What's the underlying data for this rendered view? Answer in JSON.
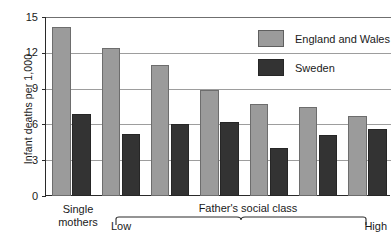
{
  "chart_data": {
    "type": "bar",
    "title": "",
    "subtitle": "",
    "xlabel": "Father's social class",
    "ylabel": "Infant deaths per 1,000",
    "ylim": [
      0,
      15
    ],
    "yticks": [
      0,
      3,
      6,
      9,
      12,
      15
    ],
    "ytick_labels": [
      "0",
      "3",
      "6",
      "9",
      "12",
      "15"
    ],
    "grid": true,
    "legend_position": "top-right",
    "categories": [
      "Single mothers",
      "Low",
      "Class 2",
      "Class 3",
      "Class 4",
      "Class 5",
      "High"
    ],
    "series": [
      {
        "name": "England and Wales",
        "color": "#9b9b9b",
        "values": [
          14.2,
          12.4,
          11.0,
          8.9,
          7.7,
          7.5,
          6.7
        ]
      },
      {
        "name": "Sweden",
        "color": "#333333",
        "values": [
          6.9,
          5.2,
          6.0,
          6.2,
          4.0,
          5.1,
          5.6
        ]
      }
    ],
    "annotations": [
      "Single mothers",
      "Low",
      "High",
      "Father's social class"
    ]
  },
  "axis": {
    "y_title": "Infant deaths per 1,000",
    "ticks": [
      "15",
      "12",
      "9",
      "6",
      "3",
      "0"
    ]
  },
  "legend": {
    "items": [
      {
        "label": "England and Wales",
        "swatch": "legend-swatch-england-and-wales"
      },
      {
        "label": "Sweden",
        "swatch": "legend-swatch-sweden"
      }
    ]
  },
  "xaxis": {
    "single_mothers_line1": "Single",
    "single_mothers_line2": "mothers",
    "low": "Low",
    "high": "High",
    "group_label": "Father's social class"
  },
  "colors": {
    "england_and_wales": "#9b9b9b",
    "sweden": "#333333",
    "axis": "#2a2a2a",
    "gridline": "#9d9d9d",
    "background": "#ffffff"
  }
}
